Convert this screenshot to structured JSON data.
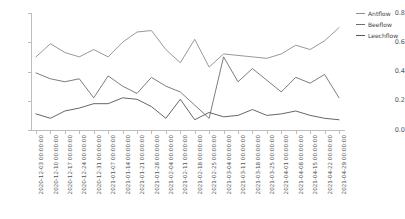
{
  "title_partial": "",
  "legend": {
    "position": "right",
    "entries": [
      {
        "label": "Antflow",
        "color": "#8c8c8c"
      },
      {
        "label": "Beeflow",
        "color": "#6e6e6e"
      },
      {
        "label": "Leechflow",
        "color": "#555555"
      }
    ]
  },
  "axes": {
    "ylabel": "",
    "xlabel": "",
    "ylim": [
      0.0,
      0.8
    ],
    "ytick_labels": [
      "0.0",
      "0.2",
      "0.4",
      "0.6",
      "0.8"
    ],
    "ytick_values": [
      0.0,
      0.2,
      0.4,
      0.6,
      0.8
    ],
    "grid": false
  },
  "chart_data": {
    "type": "line",
    "title": "",
    "xlabel": "",
    "ylabel": "",
    "ylim": [
      0.0,
      0.8
    ],
    "grid": false,
    "legend_position": "right",
    "categories": [
      "2020-12-03 00:00:00",
      "2020-12-10 00:00:00",
      "2020-12-17 00:00:00",
      "2020-12-24 00:00:00",
      "2020-12-31 00:00:00",
      "2021-01-07 00:00:00",
      "2021-01-14 00:00:00",
      "2021-01-21 00:00:00",
      "2021-01-28 00:00:00",
      "2021-02-04 00:00:00",
      "2021-02-11 00:00:00",
      "2021-02-18 00:00:00",
      "2021-02-25 00:00:00",
      "2021-03-04 00:00:00",
      "2021-03-11 00:00:00",
      "2021-03-18 00:00:00",
      "2021-03-25 00:00:00",
      "2021-04-01 00:00:00",
      "2021-04-08 00:00:00",
      "2021-04-15 00:00:00",
      "2021-04-22 00:00:00",
      "2021-04-29 00:00:00"
    ],
    "series": [
      {
        "name": "Antflow",
        "color": "#8c8c8c",
        "values": [
          0.5,
          0.59,
          0.53,
          0.5,
          0.55,
          0.5,
          0.6,
          0.67,
          0.68,
          0.55,
          0.46,
          0.62,
          0.43,
          0.52,
          0.51,
          0.5,
          0.49,
          0.52,
          0.58,
          0.55,
          0.61,
          0.7
        ]
      },
      {
        "name": "Beeflow",
        "color": "#6e6e6e",
        "values": [
          0.39,
          0.35,
          0.33,
          0.35,
          0.22,
          0.37,
          0.3,
          0.25,
          0.36,
          0.3,
          0.26,
          0.17,
          0.08,
          0.5,
          0.33,
          0.42,
          0.34,
          0.26,
          0.36,
          0.32,
          0.38,
          0.22
        ]
      },
      {
        "name": "Leechflow",
        "color": "#555555",
        "values": [
          0.11,
          0.08,
          0.13,
          0.15,
          0.18,
          0.18,
          0.22,
          0.21,
          0.16,
          0.08,
          0.21,
          0.07,
          0.12,
          0.09,
          0.1,
          0.14,
          0.1,
          0.11,
          0.13,
          0.1,
          0.08,
          0.07
        ]
      }
    ]
  }
}
